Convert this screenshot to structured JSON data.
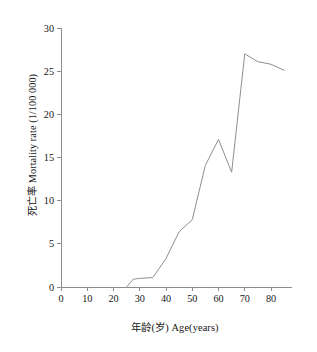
{
  "chart_data": {
    "type": "line",
    "title": "",
    "xlabel": "年龄(岁) Age(years)",
    "ylabel": "死亡率 Mortality rate (1/100 000)",
    "xlim": [
      0,
      88
    ],
    "ylim": [
      0,
      30
    ],
    "grid": false,
    "legend": null,
    "xticks": [
      "0",
      "10",
      "20",
      "30",
      "40",
      "50",
      "60",
      "70",
      "80"
    ],
    "xtick_values": [
      0,
      10,
      20,
      30,
      40,
      50,
      60,
      70,
      80
    ],
    "yticks": [
      "0",
      "5",
      "10",
      "15",
      "20",
      "25",
      "30"
    ],
    "ytick_values": [
      0,
      5,
      10,
      15,
      20,
      25,
      30
    ],
    "line_color": "#8f8f8f",
    "series": [
      {
        "name": "Mortality rate",
        "x": [
          25,
          27.5,
          30,
          35,
          40,
          45,
          50,
          55,
          60,
          65,
          70,
          75,
          80,
          85
        ],
        "values": [
          0.0,
          0.9,
          1.0,
          1.1,
          3.3,
          6.4,
          7.8,
          14.1,
          17.1,
          13.3,
          27.0,
          26.1,
          25.8,
          25.1
        ]
      }
    ]
  }
}
